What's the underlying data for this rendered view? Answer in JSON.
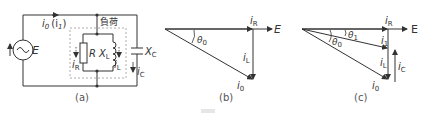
{
  "figure": {
    "panel_a": {
      "caption": "(a)",
      "source_label": "E",
      "current_main": "i",
      "current_main_sub": "0",
      "current_main_alt": "(i",
      "current_main_alt_sub": "1",
      "current_main_alt_close": ")",
      "load_label": "負荷",
      "resistor_label": "R",
      "inductor_label": "X",
      "inductor_sub": "L",
      "capacitor_label": "X",
      "capacitor_sub": "C",
      "current_r": "i",
      "current_r_sub": "R",
      "current_l": "i",
      "current_l_sub": "L",
      "current_c": "i",
      "current_c_sub": "C"
    },
    "panel_b": {
      "caption": "(b)",
      "e_label": "E",
      "ir_label": "i",
      "ir_sub": "R",
      "il_label": "i",
      "il_sub": "L",
      "i0_label": "i",
      "i0_sub": "0",
      "theta_label": "θ",
      "theta_sub": "0"
    },
    "panel_c": {
      "caption": "(c)",
      "e_label": "E",
      "ir_label": "i",
      "ir_sub": "R",
      "i1_label": "i",
      "i1_sub": "1",
      "il_label": "i",
      "il_sub": "L",
      "ic_label": "i",
      "ic_sub": "C",
      "i0_label": "i",
      "i0_sub": "0",
      "theta0_label": "θ",
      "theta0_sub": "0",
      "theta1_label": "θ",
      "theta1_sub": "1"
    },
    "colors": {
      "line": "#333333",
      "dashed_box": "#999999"
    }
  }
}
